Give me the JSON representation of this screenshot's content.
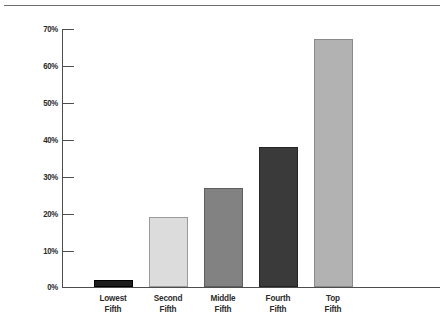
{
  "chart_data": {
    "type": "bar",
    "title": "",
    "subtitle": "",
    "xlabel": "",
    "ylabel": "",
    "categories": [
      "Lowest Fifth",
      "Second Fifth",
      "Middle Fifth",
      "Fourth Fifth",
      "Top Fifth"
    ],
    "category_lines": [
      [
        "Lowest",
        "Fifth"
      ],
      [
        "Second",
        "Fifth"
      ],
      [
        "Middle",
        "Fifth"
      ],
      [
        "Fourth",
        "Fifth"
      ],
      [
        "Top",
        "Fifth"
      ]
    ],
    "values": [
      2,
      19,
      27,
      38,
      67.5
    ],
    "value_labels": [
      "2%",
      "19%",
      "27%",
      "38%",
      "67.5%"
    ],
    "bar_colors": [
      "#1c1c1c",
      "#dcdcdc",
      "#828282",
      "#3a3a3a",
      "#b2b2b2"
    ],
    "bar_border_colors": [
      "#000000",
      "#9a9a9a",
      "#5e5e5e",
      "#242424",
      "#8a8a8a"
    ],
    "ylim": [
      0,
      70
    ],
    "ytick_values": [
      0,
      10,
      20,
      30,
      40,
      50,
      60,
      70
    ],
    "ytick_labels": [
      "0%",
      "10%",
      "20%",
      "30%",
      "40%",
      "50%",
      "60%",
      "70%"
    ],
    "grid": false,
    "legend": null,
    "legend_position": "none",
    "axis_color": "#4d4d4d",
    "text_color": "#2b2b2b",
    "background": "#ffffff",
    "top_rule_color": "#6e6e6e"
  }
}
